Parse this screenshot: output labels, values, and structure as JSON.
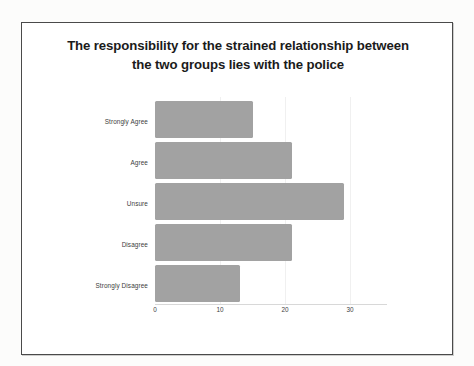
{
  "document": {
    "frame_border_color": "#4a4a4a",
    "background_color": "#ffffff"
  },
  "chart_data": {
    "type": "bar",
    "orientation": "horizontal",
    "title": "The responsibility for the strained relationship between the two groups lies with the police",
    "title_lines": [
      "The responsibility for the strained relationship between",
      "the two groups lies with the police"
    ],
    "categories": [
      "Strongly Agree",
      "Agree",
      "Unsure",
      "Disagree",
      "Strongly Disagree"
    ],
    "values": [
      15,
      21,
      29,
      21,
      13
    ],
    "xlabel": "",
    "ylabel": "",
    "xlim": [
      0,
      33
    ],
    "xticks": [
      0,
      10,
      20,
      30
    ],
    "xtick_labels": [
      "0",
      "10",
      "20",
      "30"
    ],
    "grid": true,
    "legend": false,
    "bar_color": "#a2a2a2",
    "text_color": "#3d3d3d"
  }
}
